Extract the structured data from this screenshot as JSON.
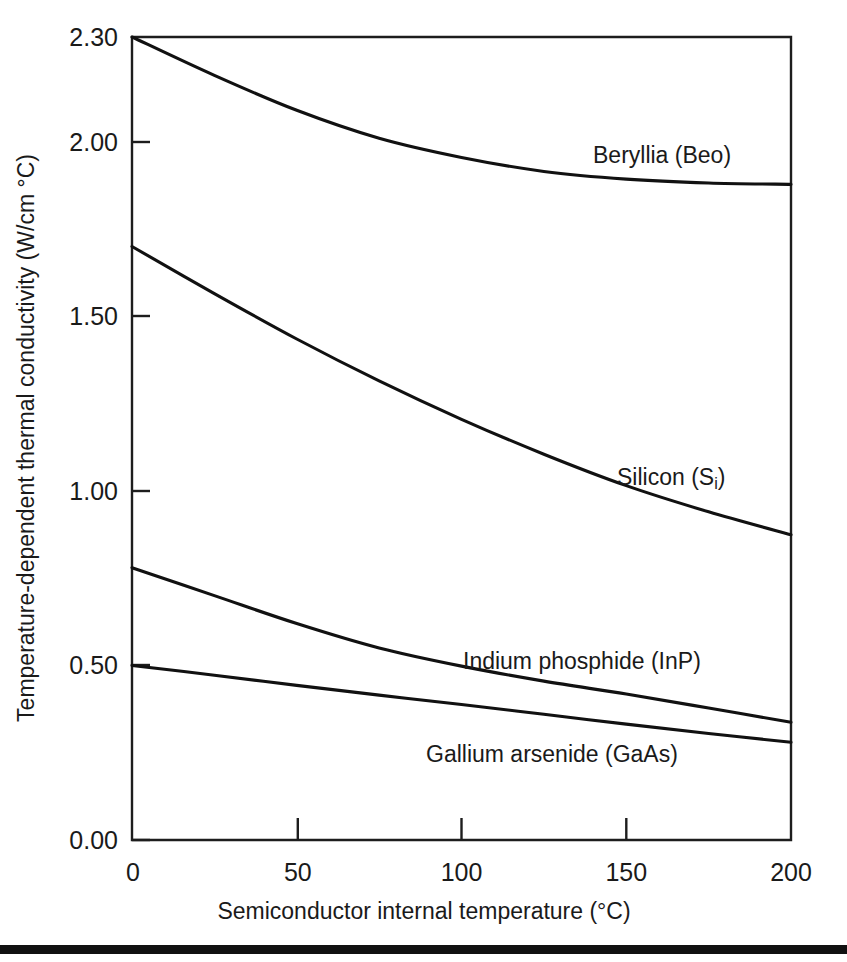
{
  "figure": {
    "title": "",
    "y_axis_title": "Temperature-dependent thermal conductivity (W/cm °C)",
    "x_axis_title": "Semiconductor internal temperature (°C)"
  },
  "chart_data": {
    "type": "line",
    "title": "",
    "xlabel": "Semiconductor internal temperature (°C)",
    "ylabel": "Temperature-dependent thermal conductivity (W/cm °C)",
    "xlim": [
      0,
      200
    ],
    "ylim": [
      0.0,
      2.3
    ],
    "grid": false,
    "legend": "inline-curve-labels",
    "xticks": [
      0,
      50,
      100,
      150,
      200
    ],
    "xtick_labels": [
      "0",
      "50",
      "100",
      "150",
      "200"
    ],
    "yticks": [
      0.0,
      0.5,
      1.0,
      1.5,
      2.0,
      2.3
    ],
    "ytick_labels": [
      "0.00",
      "0.50",
      "1.00",
      "1.50",
      "2.00",
      "2.30"
    ],
    "x": [
      0,
      25,
      50,
      75,
      100,
      125,
      150,
      175,
      200
    ],
    "series": [
      {
        "name": "Beryllia (Beo)",
        "label_text": "Beryllia (Beo)",
        "label_sub": "",
        "values": [
          2.3,
          2.19,
          2.09,
          2.01,
          1.955,
          1.915,
          1.893,
          1.882,
          1.878
        ]
      },
      {
        "name": "Silicon (Si)",
        "label_text": "Silicon (S",
        "label_sub": "i",
        "label_tail": ")",
        "values": [
          1.7,
          1.565,
          1.435,
          1.315,
          1.205,
          1.105,
          1.015,
          0.94,
          0.874
        ]
      },
      {
        "name": "Indium phosphide (InP)",
        "label_text": "Indium phosphide (InP)",
        "label_sub": "",
        "values": [
          0.78,
          0.7,
          0.62,
          0.55,
          0.498,
          0.455,
          0.418,
          0.378,
          0.337
        ]
      },
      {
        "name": "Gallium arsenide (GaAs)",
        "label_text": "Gallium arsenide (GaAs)",
        "label_sub": "",
        "values": [
          0.5,
          0.472,
          0.443,
          0.415,
          0.388,
          0.36,
          0.332,
          0.305,
          0.28
        ]
      }
    ],
    "annotations": [
      {
        "text": "Beryllia (Beo)",
        "x": 155,
        "y": 2.0
      },
      {
        "text": "Silicon (Si)",
        "x": 160,
        "y": 1.035
      },
      {
        "text": "Indium phosphide (InP)",
        "x": 108,
        "y": 0.555
      },
      {
        "text": "Gallium arsenide (GaAs)",
        "x": 96,
        "y": 0.265
      }
    ]
  }
}
